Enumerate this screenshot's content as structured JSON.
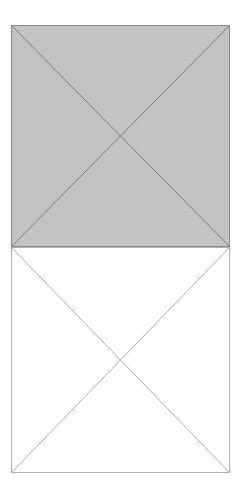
{
  "document": {
    "title": "Image Placeholder Wireframe",
    "background_color": "#ffffff",
    "width": 240,
    "height": 499,
    "text_content": "",
    "has_text": false
  },
  "graphic": {
    "type": "placeholder-crossbox-stack",
    "description": "Two stacked rectangles each marked with crossed diagonals, the upper one filled gray and the lower one left blank",
    "box_count": 2,
    "shapes": [
      {
        "name": "upper-placeholder-box",
        "role": "filled-image-placeholder",
        "fill_color": "#c3c3c3",
        "stroke_color": "#8a8a8a",
        "diagonal_color": "#7c7c7c",
        "stroke_width": 1,
        "diagonal_width": 1,
        "x": 11,
        "y": 25,
        "width": 219,
        "height": 222,
        "center_x": 120.5,
        "center_y": 136,
        "corners": {
          "top_left": "11,25",
          "top_right": "230,25",
          "bottom_right": "230,247",
          "bottom_left": "11,247"
        }
      },
      {
        "name": "lower-placeholder-box",
        "role": "empty-image-placeholder",
        "fill_color": "#ffffff",
        "stroke_color": "#b2b2b2",
        "diagonal_color": "#aeaeae",
        "stroke_width": 1,
        "diagonal_width": 1,
        "x": 11,
        "y": 247,
        "width": 219,
        "height": 226,
        "center_x": 120.5,
        "center_y": 360,
        "corners": {
          "top_left": "11,247",
          "top_right": "230,247",
          "bottom_right": "230,473",
          "bottom_left": "11,473"
        }
      }
    ],
    "shared_edge": {
      "name": "divider-edge",
      "y": 247,
      "x_start": 11,
      "x_end": 230,
      "color": "#8a8a8a"
    },
    "margins": {
      "left": 11,
      "right": 10,
      "top": 25,
      "bottom": 26
    }
  }
}
